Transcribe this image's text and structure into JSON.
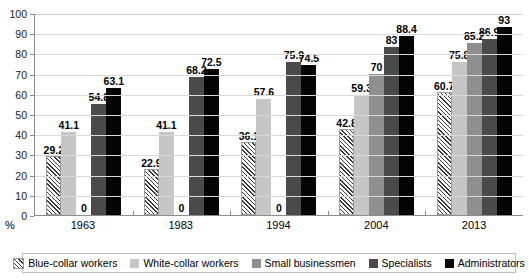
{
  "chart_data": {
    "type": "bar",
    "title": "",
    "xlabel": "",
    "ylabel": "%",
    "ylim": [
      0,
      100
    ],
    "yticks": [
      100,
      90,
      80,
      70,
      60,
      50,
      40,
      30,
      20,
      10,
      0
    ],
    "grid": true,
    "legend_position": "bottom",
    "categories": [
      "1963",
      "1983",
      "1994",
      "2004",
      "2013"
    ],
    "series": [
      {
        "name": "Blue-collar workers",
        "color": "#ffffff",
        "pattern": "diagonal-hatch",
        "values": [
          29.2,
          22.9,
          36.1,
          42.8,
          60.7
        ],
        "labels": [
          "29.2",
          "22.9",
          "36.1",
          "42.8",
          "60.7"
        ]
      },
      {
        "name": "White-collar workers",
        "color": "#c6c6c6",
        "pattern": "solid",
        "values": [
          41.1,
          41.1,
          57.6,
          59.3,
          75.8
        ],
        "labels": [
          "41.1",
          "41.1",
          "57.6",
          "59.3",
          "75.8"
        ]
      },
      {
        "name": "Small businessmen",
        "color": "#8f8f8f",
        "pattern": "solid",
        "values": [
          0,
          0,
          0,
          70,
          85.2
        ],
        "labels": [
          "0",
          "0",
          "0",
          "70",
          "85.2"
        ]
      },
      {
        "name": "Specialists",
        "color": "#4a4a4a",
        "pattern": "solid",
        "values": [
          54.8,
          68.2,
          75.9,
          83,
          86.9
        ],
        "labels": [
          "54.8",
          "68.2",
          "75.9",
          "83",
          "86.9"
        ]
      },
      {
        "name": "Administrators",
        "color": "#050505",
        "pattern": "solid",
        "values": [
          63.1,
          72.5,
          74.5,
          88.4,
          93
        ],
        "labels": [
          "63.1",
          "72.5",
          "74.5",
          "88.4",
          "93"
        ]
      }
    ]
  },
  "axis": {
    "percent_marker": "%"
  }
}
